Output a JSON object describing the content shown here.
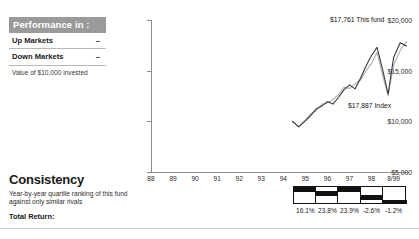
{
  "performance_box": {
    "header": "Performance in :",
    "rows": [
      {
        "label": "Up Markets",
        "value": "–"
      },
      {
        "label": "Down Markets",
        "value": "–"
      }
    ],
    "note": "Value of $10,000 invested"
  },
  "consistency": {
    "title": "Consistency",
    "subtitle": "Year-by-year quartile ranking of this fund against only similar rivals",
    "total_return_label": "Total Return:"
  },
  "chart_data": {
    "type": "line",
    "title": "",
    "xlabel": "",
    "ylabel": "",
    "ylim": [
      5000,
      20000
    ],
    "yticks": [
      "$5,000",
      "$10,000",
      "$15,000",
      "$20,000"
    ],
    "ytick_values": [
      5000,
      10000,
      15000,
      20000
    ],
    "categories": [
      "88",
      "89",
      "90",
      "91",
      "92",
      "93",
      "94",
      "95",
      "96",
      "97",
      "98",
      "8/99"
    ],
    "grid": false,
    "legend": "annotations",
    "annotations": [
      {
        "text": "$17,761 This fund",
        "value": 17761,
        "series": "This fund"
      },
      {
        "text": "$17,887 Index",
        "value": 17887,
        "series": "Index"
      }
    ],
    "series": [
      {
        "name": "This fund",
        "color": "#3a3a3a",
        "x": [
          94.4,
          94.7,
          95.0,
          95.25,
          95.5,
          95.75,
          96.0,
          96.25,
          96.5,
          96.75,
          97.0,
          97.25,
          97.5,
          97.75,
          98.0,
          98.25,
          98.5,
          98.75,
          99.0,
          99.3,
          99.6
        ],
        "values": [
          10050,
          9450,
          10050,
          10600,
          11250,
          11500,
          11950,
          11700,
          12350,
          13100,
          13600,
          13200,
          14250,
          15450,
          16500,
          17300,
          15150,
          12700,
          16300,
          17761,
          17400
        ]
      },
      {
        "name": "Index",
        "color": "#b0b0b0",
        "x": [
          94.4,
          94.7,
          95.0,
          95.25,
          95.5,
          95.75,
          96.0,
          96.25,
          96.5,
          96.75,
          97.0,
          97.25,
          97.5,
          97.75,
          98.0,
          98.25,
          98.5,
          98.75,
          99.0,
          99.3,
          99.6
        ],
        "values": [
          9950,
          9500,
          10150,
          10750,
          11050,
          11700,
          11800,
          12150,
          12600,
          13350,
          13250,
          13700,
          14050,
          15000,
          15700,
          16800,
          14600,
          12500,
          15550,
          17000,
          17887
        ]
      }
    ],
    "quartiles": {
      "years": [
        "95",
        "96",
        "97",
        "98",
        "8/99"
      ],
      "ranks": [
        1,
        2,
        1,
        3,
        4
      ],
      "returns": [
        "16.1%",
        "23.8%",
        "23.9%",
        "-2.6%",
        "-1.2%"
      ]
    }
  }
}
